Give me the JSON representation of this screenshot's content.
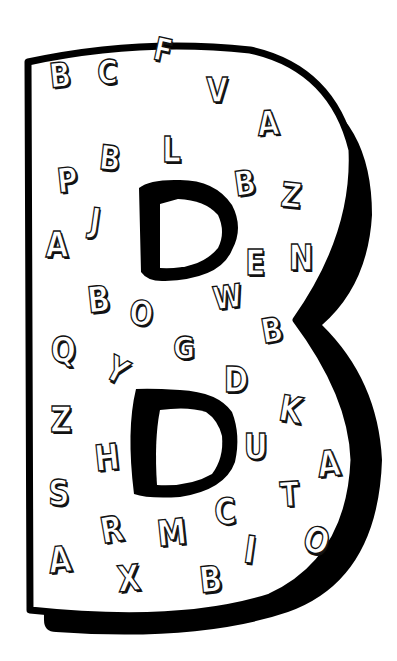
{
  "colors": {
    "outline": "#000000",
    "fill": "#ffffff",
    "background": "#ffffff"
  },
  "big_letter": "B",
  "letters": [
    {
      "char": "B",
      "x": 58,
      "y": 75,
      "rot": -6,
      "size": 34
    },
    {
      "char": "C",
      "x": 106,
      "y": 72,
      "rot": 0,
      "size": 34
    },
    {
      "char": "F",
      "x": 163,
      "y": 50,
      "rot": 12,
      "size": 32
    },
    {
      "char": "V",
      "x": 215,
      "y": 90,
      "rot": 0,
      "size": 34
    },
    {
      "char": "A",
      "x": 266,
      "y": 123,
      "rot": -4,
      "size": 34
    },
    {
      "char": "L",
      "x": 172,
      "y": 150,
      "rot": 0,
      "size": 36
    },
    {
      "char": "P",
      "x": 66,
      "y": 180,
      "rot": -6,
      "size": 34
    },
    {
      "char": "B",
      "x": 108,
      "y": 158,
      "rot": 6,
      "size": 34
    },
    {
      "char": "B",
      "x": 243,
      "y": 183,
      "rot": -8,
      "size": 34
    },
    {
      "char": "Z",
      "x": 290,
      "y": 195,
      "rot": 6,
      "size": 34
    },
    {
      "char": "A",
      "x": 55,
      "y": 245,
      "rot": 0,
      "size": 36
    },
    {
      "char": "J",
      "x": 100,
      "y": 220,
      "rot": 8,
      "size": 34
    },
    {
      "char": "E",
      "x": 255,
      "y": 263,
      "rot": 0,
      "size": 36
    },
    {
      "char": "N",
      "x": 298,
      "y": 258,
      "rot": 0,
      "size": 36
    },
    {
      "char": "B",
      "x": 97,
      "y": 300,
      "rot": -6,
      "size": 36
    },
    {
      "char": "O",
      "x": 138,
      "y": 313,
      "rot": 4,
      "size": 34
    },
    {
      "char": "W",
      "x": 221,
      "y": 297,
      "rot": -8,
      "size": 32
    },
    {
      "char": "G",
      "x": 182,
      "y": 348,
      "rot": 0,
      "size": 32
    },
    {
      "char": "B",
      "x": 270,
      "y": 330,
      "rot": -10,
      "size": 34
    },
    {
      "char": "Q",
      "x": 60,
      "y": 350,
      "rot": 0,
      "size": 36
    },
    {
      "char": "Y",
      "x": 116,
      "y": 370,
      "rot": 28,
      "size": 34
    },
    {
      "char": "D",
      "x": 233,
      "y": 380,
      "rot": 0,
      "size": 36
    },
    {
      "char": "K",
      "x": 289,
      "y": 410,
      "rot": 10,
      "size": 36
    },
    {
      "char": "Z",
      "x": 60,
      "y": 420,
      "rot": 0,
      "size": 36
    },
    {
      "char": "H",
      "x": 104,
      "y": 458,
      "rot": -6,
      "size": 36
    },
    {
      "char": "U",
      "x": 253,
      "y": 447,
      "rot": 0,
      "size": 36
    },
    {
      "char": "A",
      "x": 327,
      "y": 464,
      "rot": -6,
      "size": 36
    },
    {
      "char": "S",
      "x": 58,
      "y": 493,
      "rot": 0,
      "size": 36
    },
    {
      "char": "T",
      "x": 289,
      "y": 494,
      "rot": -4,
      "size": 34
    },
    {
      "char": "R",
      "x": 110,
      "y": 530,
      "rot": -10,
      "size": 36
    },
    {
      "char": "M",
      "x": 166,
      "y": 533,
      "rot": -6,
      "size": 36
    },
    {
      "char": "C",
      "x": 224,
      "y": 512,
      "rot": -4,
      "size": 36
    },
    {
      "char": "I",
      "x": 256,
      "y": 550,
      "rot": 8,
      "size": 38
    },
    {
      "char": "O",
      "x": 313,
      "y": 541,
      "rot": 18,
      "size": 36
    },
    {
      "char": "A",
      "x": 58,
      "y": 560,
      "rot": -6,
      "size": 36
    },
    {
      "char": "X",
      "x": 127,
      "y": 579,
      "rot": -6,
      "size": 36
    },
    {
      "char": "B",
      "x": 209,
      "y": 580,
      "rot": -6,
      "size": 36
    }
  ]
}
